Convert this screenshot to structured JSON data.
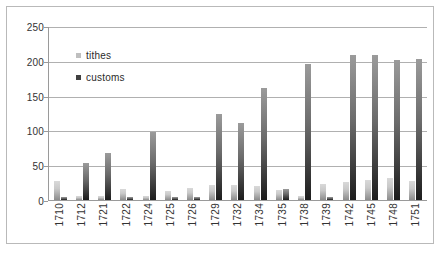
{
  "chart_data": {
    "type": "bar",
    "title": "",
    "subtitle": "",
    "xlabel": "",
    "ylabel": "",
    "ylim": [
      0,
      250
    ],
    "yticks": [
      0,
      50,
      100,
      150,
      200,
      250
    ],
    "ytick_labels": [
      "0",
      "50",
      "100",
      "150",
      "200",
      "250"
    ],
    "grid": true,
    "legend_position": "inside-top-left",
    "categories": [
      "1710",
      "1712",
      "1721",
      "1722",
      "1724",
      "1725",
      "1726",
      "1729",
      "1732",
      "1734",
      "1735",
      "1738",
      "1739",
      "1742",
      "1745",
      "1748",
      "1751"
    ],
    "series": [
      {
        "name": "tithes",
        "color": "#c9c9c9",
        "values": [
          28,
          6,
          6,
          16,
          6,
          13,
          17,
          22,
          21,
          20,
          14,
          6,
          23,
          26,
          29,
          32,
          28
        ]
      },
      {
        "name": "customs",
        "color": "#2b2b2b",
        "values": [
          4,
          53,
          68,
          4,
          98,
          4,
          4,
          123,
          110,
          161,
          16,
          196,
          4,
          208,
          209,
          201,
          202
        ]
      }
    ]
  },
  "legend": {
    "items": [
      {
        "label": "tithes",
        "swatch": "tithes"
      },
      {
        "label": "customs",
        "swatch": "customs"
      }
    ]
  }
}
